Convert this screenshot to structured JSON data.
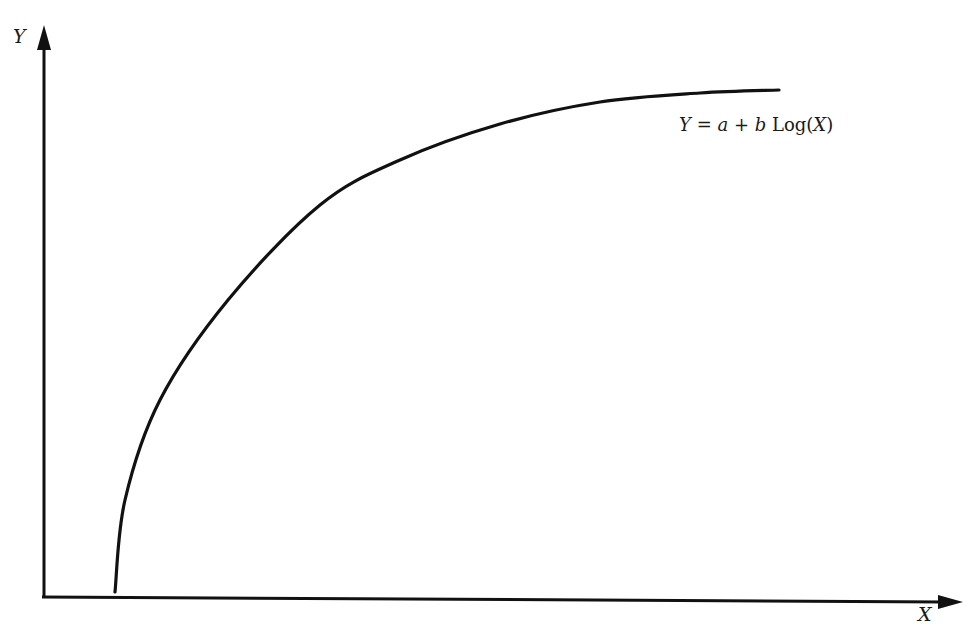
{
  "chart_data": {
    "type": "line",
    "title": "",
    "xlabel": "X",
    "ylabel": "Y",
    "grid": false,
    "legend": null,
    "ticks": {
      "x": [],
      "y": []
    },
    "annotations": [
      {
        "text": "Y = a + b Log(X)",
        "position": "upper right, below curve end"
      }
    ],
    "series": [
      {
        "name": "Y = a + b Log(X)",
        "description": "logarithmic curve, steep rise near small X then flattening",
        "pixel_points": [
          [
            115,
            592
          ],
          [
            125,
            500
          ],
          [
            160,
            400
          ],
          [
            228,
            300
          ],
          [
            320,
            205
          ],
          [
            400,
            160
          ],
          [
            500,
            124
          ],
          [
            600,
            102
          ],
          [
            700,
            93
          ],
          [
            779,
            90
          ]
        ]
      }
    ]
  },
  "labels": {
    "y_axis": "Y",
    "x_axis": "X",
    "equation": {
      "lhs": "Y",
      "eq": "=",
      "a": "a",
      "plus": "+",
      "b": "b",
      "fn": "Log(",
      "arg": "X",
      "close": ")"
    }
  },
  "colors": {
    "ink": "#111111",
    "background": "#ffffff"
  }
}
